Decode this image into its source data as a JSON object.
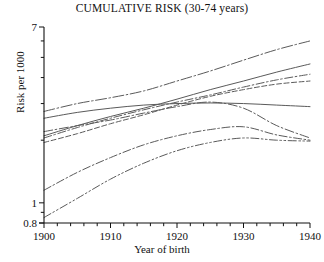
{
  "chart_data": {
    "type": "line",
    "title": "CUMULATIVE RISK (30-74 years)",
    "xlabel": "Year of birth",
    "ylabel": "Risk per 1000",
    "xlim": [
      1900,
      1940
    ],
    "ylim": [
      0.8,
      7
    ],
    "yscale": "log",
    "grid": false,
    "legend": "none",
    "xticks": [
      1900,
      1910,
      1920,
      1930,
      1940
    ],
    "xticklabels": [
      "1900",
      "1910",
      "1920",
      "1930",
      "1940"
    ],
    "xminor_tick_step": 2,
    "yticks": [
      0.8,
      1,
      2,
      3,
      4,
      5,
      6,
      7
    ],
    "yticklabels_shown": [
      "7",
      "1",
      "0.8"
    ],
    "x": [
      1900,
      1905,
      1910,
      1915,
      1920,
      1925,
      1930,
      1935,
      1940
    ],
    "series": [
      {
        "name": "series-1",
        "dash": "long-dash-dot",
        "values": [
          2.75,
          3.0,
          3.2,
          3.45,
          3.85,
          4.3,
          4.85,
          5.45,
          6.0
        ]
      },
      {
        "name": "series-2",
        "dash": "solid",
        "values": [
          2.1,
          2.35,
          2.6,
          2.85,
          3.15,
          3.5,
          3.85,
          4.25,
          4.65
        ]
      },
      {
        "name": "series-3",
        "dash": "dash-dot",
        "values": [
          2.05,
          2.3,
          2.55,
          2.8,
          3.05,
          3.3,
          3.6,
          3.9,
          4.15
        ]
      },
      {
        "name": "series-4",
        "dash": "short-dash",
        "values": [
          1.95,
          2.15,
          2.4,
          2.65,
          2.95,
          3.25,
          3.5,
          3.72,
          3.85
        ]
      },
      {
        "name": "series-5",
        "dash": "solid",
        "values": [
          2.55,
          2.72,
          2.85,
          2.95,
          3.0,
          3.02,
          3.0,
          2.95,
          2.9
        ]
      },
      {
        "name": "series-6",
        "dash": "dash-dot-long",
        "values": [
          2.2,
          2.35,
          2.5,
          2.7,
          2.9,
          3.05,
          2.85,
          2.35,
          2.05
        ]
      },
      {
        "name": "series-7",
        "dash": "dash-dot",
        "values": [
          1.15,
          1.4,
          1.65,
          1.9,
          2.1,
          2.25,
          2.32,
          2.12,
          2.0
        ]
      },
      {
        "name": "series-8",
        "dash": "dash-dot-dot",
        "values": [
          0.85,
          1.05,
          1.3,
          1.55,
          1.78,
          1.95,
          2.05,
          2.0,
          1.98
        ]
      }
    ]
  }
}
